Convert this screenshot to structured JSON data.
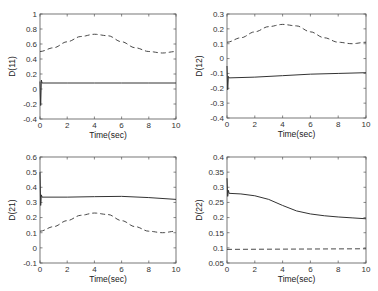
{
  "chart_data": [
    {
      "type": "line",
      "panel": "top-left",
      "title": "",
      "xlabel": "Time(sec)",
      "ylabel": "D(11)",
      "xlim": [
        0,
        10
      ],
      "ylim": [
        -0.4,
        1
      ],
      "xticks": [
        0,
        2,
        4,
        6,
        8,
        10
      ],
      "yticks": [
        -0.4,
        -0.2,
        0,
        0.2,
        0.4,
        0.6,
        0.8,
        1
      ],
      "ytick_labels": [
        "-0.4",
        "-0.2",
        "0",
        "0.2",
        "0.4",
        "0.6",
        "0.8",
        "1"
      ],
      "grid": false,
      "series": [
        {
          "name": "estimate",
          "style": "solid",
          "x": [
            0,
            0.05,
            0.1,
            0.15,
            2,
            4,
            6,
            8,
            10
          ],
          "y": [
            0.1,
            -0.22,
            0.12,
            0.08,
            0.08,
            0.08,
            0.08,
            0.08,
            0.08
          ]
        },
        {
          "name": "actual",
          "style": "dashed",
          "x": [
            0,
            1,
            2,
            3,
            4,
            5,
            6,
            7,
            8,
            9,
            10
          ],
          "y": [
            0.5,
            0.55,
            0.63,
            0.7,
            0.73,
            0.71,
            0.63,
            0.55,
            0.5,
            0.48,
            0.5
          ]
        }
      ]
    },
    {
      "type": "line",
      "panel": "top-right",
      "title": "",
      "xlabel": "Time(sec)",
      "ylabel": "D(12)",
      "xlim": [
        0,
        10
      ],
      "ylim": [
        -0.4,
        0.3
      ],
      "xticks": [
        0,
        2,
        4,
        6,
        8,
        10
      ],
      "yticks": [
        -0.4,
        -0.3,
        -0.2,
        -0.1,
        0,
        0.1,
        0.2,
        0.3
      ],
      "ytick_labels": [
        "-0.4",
        "-0.3",
        "-0.2",
        "-0.1",
        "0",
        "0.1",
        "0.2",
        "0.3"
      ],
      "grid": false,
      "series": [
        {
          "name": "estimate",
          "style": "solid",
          "x": [
            0,
            0.05,
            0.1,
            0.15,
            2,
            4,
            6,
            8,
            10
          ],
          "y": [
            -0.05,
            -0.21,
            -0.12,
            -0.13,
            -0.125,
            -0.115,
            -0.105,
            -0.1,
            -0.095
          ]
        },
        {
          "name": "actual",
          "style": "dashed",
          "x": [
            0,
            1,
            2,
            3,
            4,
            5,
            6,
            7,
            8,
            9,
            10
          ],
          "y": [
            0.11,
            0.14,
            0.18,
            0.215,
            0.23,
            0.22,
            0.18,
            0.14,
            0.11,
            0.1,
            0.11
          ]
        }
      ]
    },
    {
      "type": "line",
      "panel": "bottom-left",
      "title": "",
      "xlabel": "Time(sec)",
      "ylabel": "D(21)",
      "xlim": [
        0,
        10
      ],
      "ylim": [
        -0.1,
        0.6
      ],
      "xticks": [
        0,
        2,
        4,
        6,
        8,
        10
      ],
      "yticks": [
        -0.1,
        0,
        0.1,
        0.2,
        0.3,
        0.4,
        0.5,
        0.6
      ],
      "ytick_labels": [
        "-0.1",
        "0",
        "0.1",
        "0.2",
        "0.3",
        "0.4",
        "0.5",
        "0.6"
      ],
      "grid": false,
      "series": [
        {
          "name": "estimate",
          "style": "solid",
          "x": [
            0,
            0.05,
            0.1,
            0.15,
            2,
            4,
            6,
            8,
            10
          ],
          "y": [
            0.5,
            0.28,
            0.35,
            0.335,
            0.335,
            0.338,
            0.34,
            0.332,
            0.32
          ]
        },
        {
          "name": "actual",
          "style": "dashed",
          "x": [
            0,
            1,
            2,
            3,
            4,
            5,
            6,
            7,
            8,
            9,
            10
          ],
          "y": [
            0.11,
            0.14,
            0.18,
            0.215,
            0.23,
            0.22,
            0.18,
            0.14,
            0.11,
            0.1,
            0.11
          ]
        }
      ]
    },
    {
      "type": "line",
      "panel": "bottom-right",
      "title": "",
      "xlabel": "Time(sec)",
      "ylabel": "D(22)",
      "xlim": [
        0,
        10
      ],
      "ylim": [
        0.05,
        0.4
      ],
      "xticks": [
        0,
        2,
        4,
        6,
        8,
        10
      ],
      "yticks": [
        0.05,
        0.1,
        0.15,
        0.2,
        0.25,
        0.3,
        0.35,
        0.4
      ],
      "ytick_labels": [
        "0.05",
        "0.1",
        "0.15",
        "0.2",
        "0.25",
        "0.3",
        "0.35",
        "0.4"
      ],
      "grid": false,
      "series": [
        {
          "name": "estimate",
          "style": "solid",
          "x": [
            0,
            0.05,
            0.1,
            0.15,
            1,
            2,
            3,
            4,
            5,
            6,
            7,
            8,
            9,
            10
          ],
          "y": [
            0.33,
            0.27,
            0.29,
            0.28,
            0.278,
            0.272,
            0.26,
            0.24,
            0.222,
            0.212,
            0.206,
            0.202,
            0.199,
            0.196
          ]
        },
        {
          "name": "actual",
          "style": "dashed",
          "x": [
            0,
            10
          ],
          "y": [
            0.095,
            0.097
          ]
        }
      ]
    }
  ],
  "panels": [
    {
      "box": [
        40,
        14,
        176,
        119
      ]
    },
    {
      "box": [
        227,
        14,
        366,
        118
      ]
    },
    {
      "box": [
        40,
        157,
        176,
        263
      ]
    },
    {
      "box": [
        227,
        157,
        366,
        263
      ]
    }
  ],
  "colors": {
    "line": "#333333",
    "axis": "#555555",
    "text": "#333333"
  }
}
